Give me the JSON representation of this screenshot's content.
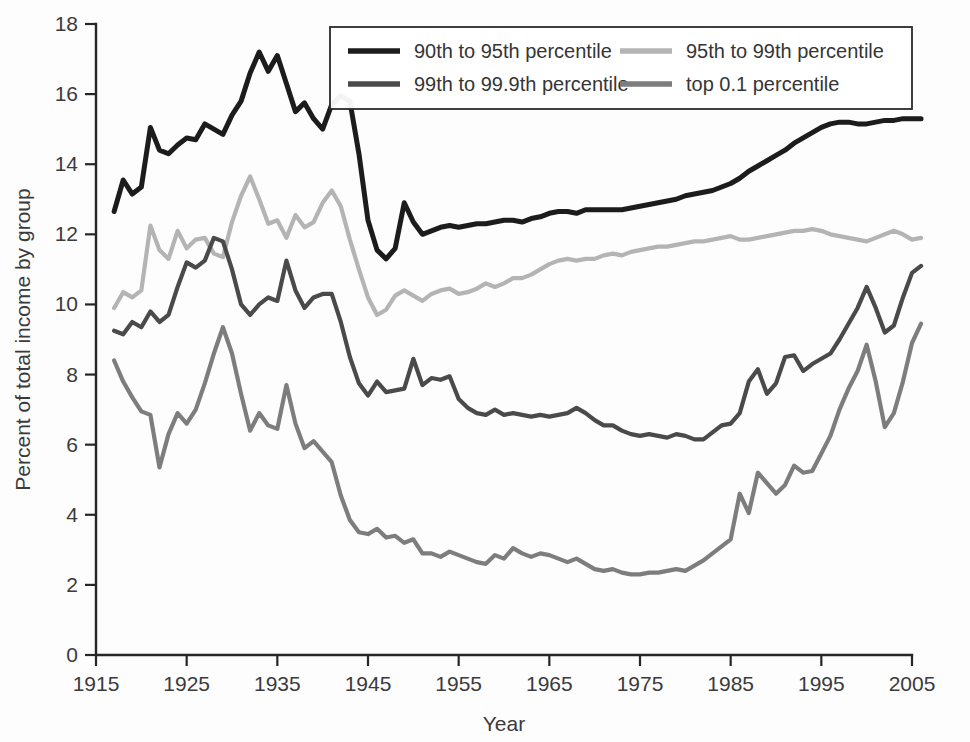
{
  "chart_data": {
    "type": "line",
    "title": "",
    "xlabel": "Year",
    "ylabel": "Percent of total income by group",
    "xlim": [
      1915,
      2005
    ],
    "ylim": [
      0,
      18
    ],
    "xticks": [
      1915,
      1925,
      1935,
      1945,
      1955,
      1965,
      1975,
      1985,
      1995,
      2005
    ],
    "yticks": [
      0,
      2,
      4,
      6,
      8,
      10,
      12,
      14,
      16,
      18
    ],
    "grid": false,
    "legend_position": "top-center",
    "x": [
      1917,
      1918,
      1919,
      1920,
      1921,
      1922,
      1923,
      1924,
      1925,
      1926,
      1927,
      1928,
      1929,
      1930,
      1931,
      1932,
      1933,
      1934,
      1935,
      1936,
      1937,
      1938,
      1939,
      1940,
      1941,
      1942,
      1943,
      1944,
      1945,
      1946,
      1947,
      1948,
      1949,
      1950,
      1951,
      1952,
      1953,
      1954,
      1955,
      1956,
      1957,
      1958,
      1959,
      1960,
      1961,
      1962,
      1963,
      1964,
      1965,
      1966,
      1967,
      1968,
      1969,
      1970,
      1971,
      1972,
      1973,
      1974,
      1975,
      1976,
      1977,
      1978,
      1979,
      1980,
      1981,
      1982,
      1983,
      1984,
      1985,
      1986,
      1987,
      1988,
      1989,
      1990,
      1991,
      1992,
      1993,
      1994,
      1995,
      1996,
      1997,
      1998,
      1999,
      2000,
      2001,
      2002,
      2003,
      2004,
      2005,
      2006
    ],
    "series": [
      {
        "name": "90th to 95th percentile",
        "color": "#1c1c1c",
        "values": [
          12.65,
          13.55,
          13.15,
          13.35,
          15.05,
          14.4,
          14.3,
          14.55,
          14.75,
          14.7,
          15.15,
          15.0,
          14.85,
          15.4,
          15.8,
          16.6,
          17.2,
          16.65,
          17.1,
          16.3,
          15.5,
          15.75,
          15.3,
          15.0,
          15.7,
          15.95,
          15.8,
          14.3,
          12.4,
          11.55,
          11.3,
          11.6,
          12.9,
          12.35,
          12.0,
          12.1,
          12.2,
          12.25,
          12.2,
          12.25,
          12.3,
          12.3,
          12.35,
          12.4,
          12.4,
          12.35,
          12.45,
          12.5,
          12.6,
          12.65,
          12.65,
          12.6,
          12.7,
          12.7,
          12.7,
          12.7,
          12.7,
          12.75,
          12.8,
          12.85,
          12.9,
          12.95,
          13.0,
          13.1,
          13.15,
          13.2,
          13.25,
          13.35,
          13.45,
          13.6,
          13.8,
          13.95,
          14.1,
          14.25,
          14.4,
          14.6,
          14.75,
          14.9,
          15.05,
          15.15,
          15.2,
          15.2,
          15.15,
          15.15,
          15.2,
          15.25,
          15.25,
          15.3,
          15.3,
          15.3
        ]
      },
      {
        "name": "95th to 99th percentile",
        "color": "#b4b4b4",
        "values": [
          9.9,
          10.35,
          10.2,
          10.4,
          12.25,
          11.55,
          11.3,
          12.1,
          11.6,
          11.85,
          11.9,
          11.45,
          11.35,
          12.35,
          13.1,
          13.65,
          13.0,
          12.3,
          12.4,
          11.9,
          12.55,
          12.2,
          12.35,
          12.9,
          13.25,
          12.8,
          11.85,
          11.0,
          10.2,
          9.7,
          9.85,
          10.25,
          10.4,
          10.25,
          10.1,
          10.3,
          10.4,
          10.45,
          10.3,
          10.35,
          10.45,
          10.6,
          10.5,
          10.6,
          10.75,
          10.75,
          10.85,
          11.0,
          11.15,
          11.25,
          11.3,
          11.25,
          11.3,
          11.3,
          11.4,
          11.45,
          11.4,
          11.5,
          11.55,
          11.6,
          11.65,
          11.65,
          11.7,
          11.75,
          11.8,
          11.8,
          11.85,
          11.9,
          11.95,
          11.85,
          11.85,
          11.9,
          11.95,
          12.0,
          12.05,
          12.1,
          12.1,
          12.15,
          12.1,
          12.0,
          11.95,
          11.9,
          11.85,
          11.8,
          11.9,
          12.0,
          12.1,
          12.0,
          11.85,
          11.9
        ]
      },
      {
        "name": "99th to 99.9th percentile",
        "color": "#4a4a4a",
        "values": [
          9.25,
          9.15,
          9.5,
          9.35,
          9.8,
          9.5,
          9.7,
          10.5,
          11.2,
          11.05,
          11.25,
          11.9,
          11.8,
          11.0,
          10.0,
          9.7,
          10.0,
          10.2,
          10.1,
          11.25,
          10.4,
          9.9,
          10.2,
          10.3,
          10.3,
          9.5,
          8.5,
          7.75,
          7.4,
          7.8,
          7.5,
          7.55,
          7.6,
          8.45,
          7.7,
          7.9,
          7.85,
          7.95,
          7.3,
          7.05,
          6.9,
          6.85,
          7.0,
          6.85,
          6.9,
          6.85,
          6.8,
          6.85,
          6.8,
          6.85,
          6.9,
          7.05,
          6.9,
          6.7,
          6.55,
          6.55,
          6.4,
          6.3,
          6.25,
          6.3,
          6.25,
          6.2,
          6.3,
          6.25,
          6.15,
          6.15,
          6.35,
          6.55,
          6.6,
          6.9,
          7.8,
          8.15,
          7.45,
          7.75,
          8.5,
          8.55,
          8.1,
          8.3,
          8.45,
          8.6,
          9.0,
          9.45,
          9.9,
          10.5,
          9.9,
          9.2,
          9.4,
          10.2,
          10.9,
          11.1
        ]
      },
      {
        "name": "top 0.1 percentile",
        "color": "#7d7d7d",
        "values": [
          8.4,
          7.8,
          7.35,
          6.95,
          6.85,
          5.35,
          6.3,
          6.9,
          6.6,
          7.0,
          7.75,
          8.6,
          9.35,
          8.6,
          7.45,
          6.4,
          6.9,
          6.55,
          6.45,
          7.7,
          6.6,
          5.9,
          6.1,
          5.8,
          5.5,
          4.55,
          3.85,
          3.5,
          3.45,
          3.6,
          3.35,
          3.4,
          3.2,
          3.3,
          2.9,
          2.9,
          2.8,
          2.95,
          2.85,
          2.75,
          2.65,
          2.6,
          2.85,
          2.75,
          3.05,
          2.9,
          2.8,
          2.9,
          2.85,
          2.75,
          2.65,
          2.75,
          2.6,
          2.45,
          2.4,
          2.45,
          2.35,
          2.3,
          2.3,
          2.35,
          2.35,
          2.4,
          2.45,
          2.4,
          2.55,
          2.7,
          2.9,
          3.1,
          3.3,
          4.6,
          4.05,
          5.2,
          4.9,
          4.6,
          4.85,
          5.4,
          5.2,
          5.25,
          5.75,
          6.25,
          7.0,
          7.6,
          8.1,
          8.85,
          7.8,
          6.5,
          6.9,
          7.8,
          8.9,
          9.45
        ]
      }
    ]
  },
  "legend": {
    "entries": [
      {
        "label": "90th to 95th percentile",
        "color": "#1c1c1c"
      },
      {
        "label": "95th to 99th percentile",
        "color": "#b4b4b4"
      },
      {
        "label": "99th to 99.9th percentile",
        "color": "#4a4a4a"
      },
      {
        "label": "top 0.1 percentile",
        "color": "#7d7d7d"
      }
    ]
  },
  "axes": {
    "x_title": "Year",
    "y_title": "Percent of total income by group",
    "x_tick_labels": [
      "1915",
      "1925",
      "1935",
      "1945",
      "1955",
      "1965",
      "1975",
      "1985",
      "1995",
      "2005"
    ],
    "y_tick_labels": [
      "0",
      "2",
      "4",
      "6",
      "8",
      "10",
      "12",
      "14",
      "16",
      "18"
    ]
  }
}
